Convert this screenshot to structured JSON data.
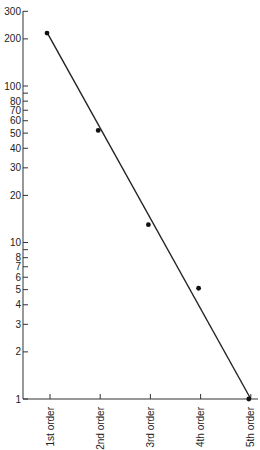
{
  "chart_data": {
    "type": "scatter",
    "title": "",
    "xlabel": "",
    "ylabel": "",
    "y_scale": "log",
    "ylim": [
      1,
      300
    ],
    "grid": false,
    "legend": "none",
    "categories": [
      "1st order",
      "2nd order",
      "3rd order",
      "4th order",
      "5th order"
    ],
    "series": [
      {
        "name": "observed",
        "values": [
          218,
          52,
          13,
          5.1,
          1
        ]
      }
    ],
    "fit_line": {
      "start": {
        "category": "1st order",
        "value": 220
      },
      "end": {
        "category": "5th order",
        "value": 1
      }
    },
    "y_ticks": [
      {
        "value": 1,
        "label": "1"
      },
      {
        "value": 2,
        "label": "2"
      },
      {
        "value": 3,
        "label": "3"
      },
      {
        "value": 4,
        "label": "4"
      },
      {
        "value": 5,
        "label": "5"
      },
      {
        "value": 6,
        "label": "6"
      },
      {
        "value": 7,
        "label": "7"
      },
      {
        "value": 8,
        "label": "8"
      },
      {
        "value": 9,
        "label": ""
      },
      {
        "value": 10,
        "label": "10"
      },
      {
        "value": 20,
        "label": "20"
      },
      {
        "value": 30,
        "label": "30"
      },
      {
        "value": 40,
        "label": "40"
      },
      {
        "value": 50,
        "label": "50"
      },
      {
        "value": 60,
        "label": "60"
      },
      {
        "value": 70,
        "label": "70"
      },
      {
        "value": 80,
        "label": "80"
      },
      {
        "value": 90,
        "label": ""
      },
      {
        "value": 100,
        "label": "100"
      },
      {
        "value": 200,
        "label": "200"
      },
      {
        "value": 300,
        "label": "300"
      }
    ]
  }
}
